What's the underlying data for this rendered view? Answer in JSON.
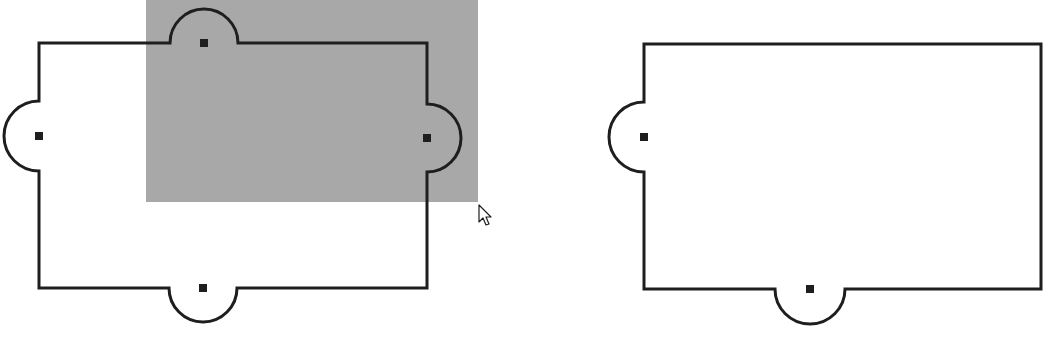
{
  "colors": {
    "background": "#ffffff",
    "stroke": "#1e1e1e",
    "selection": "#a8a8a8",
    "handle": "#1e1e1e"
  },
  "shapes": [
    {
      "id": "left-shape",
      "rect": {
        "x": 39,
        "y": 43,
        "w": 388,
        "h": 245
      },
      "bumps": [
        {
          "side": "top",
          "center": 204,
          "radius": 34
        },
        {
          "side": "left",
          "center": 136,
          "radius": 35
        },
        {
          "side": "right",
          "center": 138,
          "radius": 34
        },
        {
          "side": "bottom",
          "center": 203,
          "radius": 34
        }
      ],
      "selected": true
    },
    {
      "id": "right-shape",
      "rect": {
        "x": 644,
        "y": 44,
        "w": 397,
        "h": 245
      },
      "bumps": [
        {
          "side": "left",
          "center": 137,
          "radius": 35
        },
        {
          "side": "bottom",
          "center": 810,
          "radius": 35
        }
      ],
      "selected": false
    }
  ],
  "selection_marquee": {
    "x": 146,
    "y": 0,
    "w": 332,
    "h": 202
  },
  "cursor": {
    "icon": "arrow-cursor-icon",
    "x": 479,
    "y": 205
  }
}
